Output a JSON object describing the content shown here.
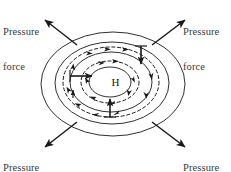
{
  "figure": {
    "width": 231,
    "height": 172,
    "background_color": "#ffffff",
    "line_color": "#1a1a1a",
    "text_color": "#3a3a3a"
  },
  "center": {
    "symbol": "H",
    "meaning": "high-pressure center",
    "x": 110,
    "y": 82
  },
  "labels": {
    "top_left": {
      "line1": "Pressure",
      "line2": "force"
    },
    "top_right": {
      "line1": "Pressure",
      "line2": "force"
    },
    "bottom_left": {
      "line1": "Pressure",
      "line2": "force"
    },
    "bottom_right": {
      "line1": "Pressure",
      "line2": "force"
    }
  },
  "isobars": [
    {
      "name": "isobar-outer",
      "cx": 113,
      "cy": 84,
      "rx": 72,
      "ry": 52
    },
    {
      "name": "isobar-second",
      "cx": 112,
      "cy": 83,
      "rx": 57,
      "ry": 41
    },
    {
      "name": "isobar-third",
      "cx": 111,
      "cy": 82,
      "rx": 41,
      "ry": 30
    },
    {
      "name": "isobar-innermost",
      "cx": 110,
      "cy": 82,
      "rx": 21,
      "ry": 15
    }
  ],
  "circulation": {
    "direction": "clockwise",
    "meaning": "anticyclonic flow around high pressure",
    "paths": [
      {
        "name": "flow-path-outer",
        "cx": 111,
        "cy": 82,
        "rx": 48,
        "ry": 35
      },
      {
        "name": "flow-path-inner",
        "cx": 110,
        "cy": 82,
        "rx": 29,
        "ry": 21
      }
    ]
  },
  "pressure_force_arrows": {
    "count": 4,
    "direction": "outward from center",
    "vectors": [
      {
        "name": "pressure-force-arrow-top-left",
        "x1": 77,
        "y1": 45,
        "x2": 44,
        "y2": 19
      },
      {
        "name": "pressure-force-arrow-top-right",
        "x1": 152,
        "y1": 45,
        "x2": 186,
        "y2": 19
      },
      {
        "name": "pressure-force-arrow-bottom-left",
        "x1": 77,
        "y1": 122,
        "x2": 44,
        "y2": 148
      },
      {
        "name": "pressure-force-arrow-bottom-right",
        "x1": 152,
        "y1": 122,
        "x2": 186,
        "y2": 148
      }
    ]
  },
  "gradient_arrows": [
    {
      "name": "gradient-arrow-left",
      "x1": 70,
      "y1": 76,
      "x2": 93,
      "y2": 76
    },
    {
      "name": "gradient-arrow-right",
      "x1": 141,
      "y1": 48,
      "x2": 141,
      "y2": 64
    },
    {
      "name": "gradient-arrow-bottom",
      "x1": 110,
      "y1": 116,
      "x2": 110,
      "y2": 99
    }
  ]
}
